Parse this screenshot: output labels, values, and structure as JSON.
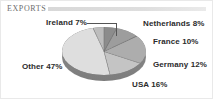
{
  "header": {
    "title": "EXPORTS",
    "bar_color": "#dcdcdc"
  },
  "chart_data": {
    "type": "pie",
    "title": "EXPORTS",
    "xlabel": "",
    "ylabel": "",
    "legend_position": "none",
    "grid": false,
    "unit": "%",
    "start_angle_deg": 0,
    "direction": "clockwise",
    "three_d": true,
    "categories": [
      "Netherlands",
      "France",
      "Germany",
      "USA",
      "Other",
      "Ireland"
    ],
    "values": [
      8,
      10,
      12,
      16,
      47,
      7
    ],
    "slice_colors": [
      "#8c8c8c",
      "#9d9d9d",
      "#adadad",
      "#c4c4c4",
      "#dedede",
      "#bdbdbd"
    ],
    "labels": [
      {
        "name": "netherlands",
        "text": "Netherlands 8%",
        "value": 8
      },
      {
        "name": "france",
        "text": "France 10%",
        "value": 10
      },
      {
        "name": "germany",
        "text": "Germany 12%",
        "value": 12
      },
      {
        "name": "usa",
        "text": "USA 16%",
        "value": 16
      },
      {
        "name": "other",
        "text": "Other 47%",
        "value": 47
      },
      {
        "name": "ireland",
        "text": "Ireland 7%",
        "value": 7
      }
    ]
  }
}
